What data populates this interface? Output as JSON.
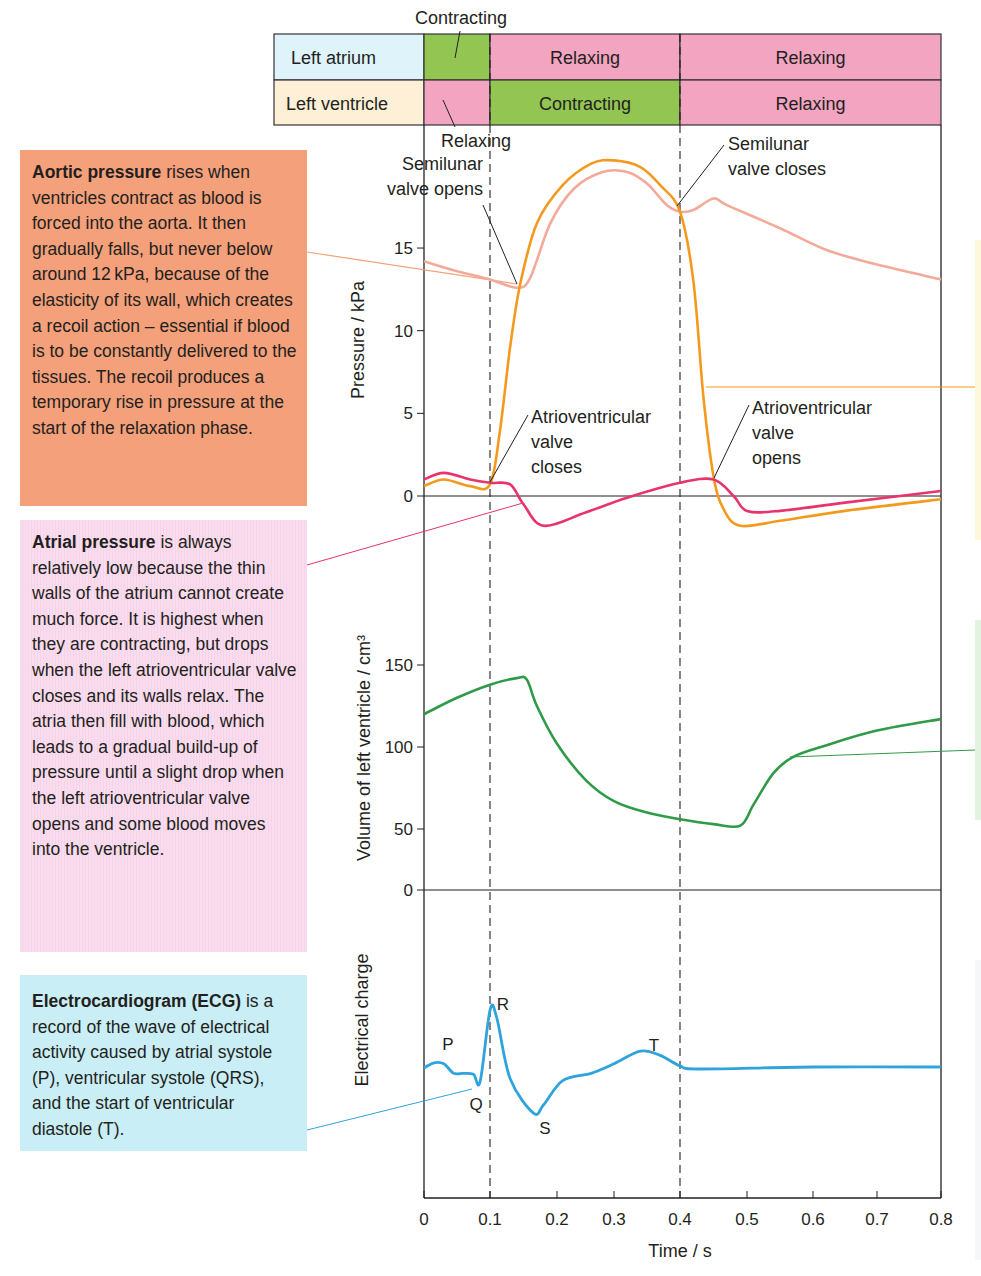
{
  "phase_table": {
    "rows": [
      {
        "label": "Left atrium",
        "label_color": "#dff3fa",
        "segments": [
          {
            "from": 0,
            "to": 0.1,
            "state": "",
            "color": "#93c553"
          },
          {
            "from": 0.1,
            "to": 0.4,
            "state": "Relaxing",
            "color": "#f2a4c0"
          },
          {
            "from": 0.4,
            "to": 0.8,
            "state": "Relaxing",
            "color": "#f2a4c0"
          }
        ]
      },
      {
        "label": "Left ventricle",
        "label_color": "#fdf0d6",
        "segments": [
          {
            "from": 0,
            "to": 0.1,
            "state": "",
            "color": "#f2a4c0"
          },
          {
            "from": 0.1,
            "to": 0.4,
            "state": "Contracting",
            "color": "#93c553"
          },
          {
            "from": 0.4,
            "to": 0.8,
            "state": "Relaxing",
            "color": "#f2a4c0"
          }
        ]
      }
    ],
    "callout_above": "Contracting",
    "callout_below": "Relaxing"
  },
  "annotations": {
    "aortic": {
      "title": "Aortic pressure",
      "body": " rises when ventricles contract as blood is forced into the aorta. It then gradually falls, but never below around 12 kPa, because of the elasticity of its wall, which creates a recoil action – essential if blood is to be constantly delivered to the tissues. The recoil produces a temporary rise in pressure at the start of the relaxation phase."
    },
    "atrial": {
      "title": "Atrial pressure",
      "body": " is always relatively low because the thin walls of the atrium cannot create much force. It is highest when they are contracting, but drops when the left atrioventricular valve closes and its walls relax. The atria then fill with blood, which leads to a gradual build-up of pressure until a slight drop when the left atrioventricular valve opens and some blood moves into the ventricle."
    },
    "ecg": {
      "title": "Electrocardiogram (ECG)",
      "body": " is a record of the wave of electrical activity caused by atrial systole (P), ventricular systole (QRS), and the start of ventricular diastole (T)."
    }
  },
  "valve_labels": {
    "semilunar_opens": [
      "Semilunar",
      "valve opens"
    ],
    "semilunar_closes": [
      "Semilunar",
      "valve closes"
    ],
    "av_closes": [
      "Atrioventricular",
      "valve",
      "closes"
    ],
    "av_opens": [
      "Atrioventricular",
      "valve",
      "opens"
    ]
  },
  "chart_data": [
    {
      "type": "line",
      "title": "Pressure changes in the left side of the heart",
      "xlabel": "Time / s",
      "ylabel": "Pressure / kPa",
      "yticks": [
        0,
        5,
        10,
        15
      ],
      "ylim": [
        -1.5,
        21
      ],
      "series": [
        {
          "name": "Aortic pressure",
          "color": "#f4aa9a",
          "points": [
            [
              0,
              14.2
            ],
            [
              0.05,
              13.6
            ],
            [
              0.1,
              13.1
            ],
            [
              0.14,
              12.6
            ],
            [
              0.16,
              13.2
            ],
            [
              0.19,
              16.5
            ],
            [
              0.23,
              18.6
            ],
            [
              0.28,
              19.6
            ],
            [
              0.32,
              19.6
            ],
            [
              0.35,
              18.9
            ],
            [
              0.38,
              17.6
            ],
            [
              0.4,
              17.2
            ],
            [
              0.42,
              17.3
            ],
            [
              0.45,
              18.0
            ],
            [
              0.47,
              17.6
            ],
            [
              0.55,
              16.2
            ],
            [
              0.62,
              14.9
            ],
            [
              0.7,
              14.0
            ],
            [
              0.8,
              13.1
            ]
          ]
        },
        {
          "name": "Ventricular pressure",
          "color": "#f39a1e",
          "points": [
            [
              0,
              0.6
            ],
            [
              0.03,
              1.0
            ],
            [
              0.07,
              0.6
            ],
            [
              0.1,
              0.7
            ],
            [
              0.115,
              4.0
            ],
            [
              0.13,
              9.0
            ],
            [
              0.145,
              12.8
            ],
            [
              0.17,
              16.5
            ],
            [
              0.21,
              18.8
            ],
            [
              0.26,
              20.1
            ],
            [
              0.3,
              20.3
            ],
            [
              0.34,
              19.9
            ],
            [
              0.37,
              18.8
            ],
            [
              0.4,
              17.2
            ],
            [
              0.42,
              13.0
            ],
            [
              0.435,
              6.0
            ],
            [
              0.45,
              1.2
            ],
            [
              0.465,
              -0.8
            ],
            [
              0.49,
              -1.8
            ],
            [
              0.55,
              -1.5
            ],
            [
              0.65,
              -0.9
            ],
            [
              0.8,
              -0.2
            ]
          ]
        },
        {
          "name": "Atrial pressure",
          "color": "#e8336b",
          "points": [
            [
              0,
              1.0
            ],
            [
              0.03,
              1.4
            ],
            [
              0.07,
              1.0
            ],
            [
              0.1,
              0.8
            ],
            [
              0.13,
              0.7
            ],
            [
              0.15,
              -0.5
            ],
            [
              0.18,
              -1.8
            ],
            [
              0.25,
              -1.0
            ],
            [
              0.32,
              -0.1
            ],
            [
              0.4,
              0.8
            ],
            [
              0.45,
              1.0
            ],
            [
              0.48,
              0.0
            ],
            [
              0.5,
              -0.9
            ],
            [
              0.55,
              -0.9
            ],
            [
              0.65,
              -0.4
            ],
            [
              0.8,
              0.3
            ]
          ]
        }
      ],
      "annotations": [
        "Semilunar valve opens",
        "Semilunar valve closes",
        "Atrioventricular valve closes",
        "Atrioventricular valve opens"
      ]
    },
    {
      "type": "line",
      "xlabel": "Time / s",
      "ylabel": "Volume of left ventricle / cm³",
      "yticks": [
        0,
        50,
        100,
        150
      ],
      "series": [
        {
          "name": "Ventricular volume",
          "color": "#2f9a48",
          "points": [
            [
              0,
              120
            ],
            [
              0.05,
              130
            ],
            [
              0.1,
              138
            ],
            [
              0.14,
              142
            ],
            [
              0.155,
              141
            ],
            [
              0.17,
              125
            ],
            [
              0.2,
              102
            ],
            [
              0.25,
              80
            ],
            [
              0.3,
              67
            ],
            [
              0.35,
              60
            ],
            [
              0.4,
              56
            ],
            [
              0.45,
              53
            ],
            [
              0.49,
              52
            ],
            [
              0.51,
              65
            ],
            [
              0.54,
              84
            ],
            [
              0.57,
              94
            ],
            [
              0.62,
              101
            ],
            [
              0.7,
              110
            ],
            [
              0.8,
              117
            ]
          ]
        }
      ]
    },
    {
      "type": "line",
      "xlabel": "Time / s",
      "ylabel": "Electrical charge",
      "series": [
        {
          "name": "ECG",
          "color": "#2ea3dc",
          "points": [
            [
              0,
              0
            ],
            [
              0.015,
              5
            ],
            [
              0.03,
              4
            ],
            [
              0.045,
              -5
            ],
            [
              0.06,
              -5
            ],
            [
              0.075,
              -6
            ],
            [
              0.085,
              -13
            ],
            [
              0.1,
              55
            ],
            [
              0.11,
              48
            ],
            [
              0.13,
              -10
            ],
            [
              0.165,
              -43
            ],
            [
              0.18,
              -35
            ],
            [
              0.21,
              -12
            ],
            [
              0.26,
              -5
            ],
            [
              0.3,
              4
            ],
            [
              0.34,
              16
            ],
            [
              0.37,
              12
            ],
            [
              0.4,
              2
            ],
            [
              0.43,
              -1
            ],
            [
              0.6,
              1
            ],
            [
              0.8,
              1
            ]
          ]
        }
      ],
      "labels": {
        "P": "P",
        "Q": "Q",
        "R": "R",
        "S": "S",
        "T": "T"
      }
    }
  ],
  "x_axis": {
    "label": "Time / s",
    "ticks": [
      "0",
      "0.1",
      "0.2",
      "0.3",
      "0.4",
      "0.5",
      "0.6",
      "0.7",
      "0.8"
    ]
  },
  "colors": {
    "aortic_box": "#f4a07a",
    "atrial_box": "#f9ddee",
    "ecg_box": "#c9eef6"
  }
}
